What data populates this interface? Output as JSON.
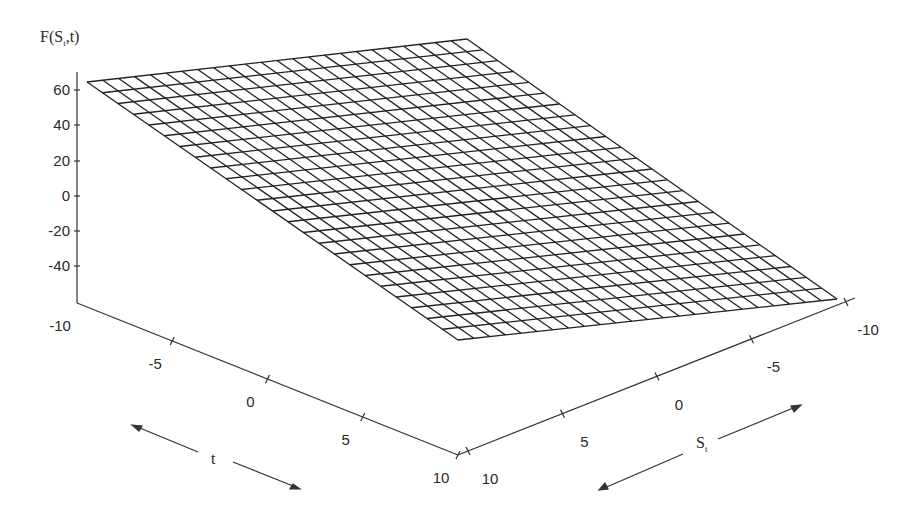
{
  "chart_data": {
    "type": "surface3d",
    "title": "",
    "zlabel": "F(S_t,t)",
    "xlabel": "t",
    "ylabel": "S_t",
    "z_ticks": [
      "60",
      "40",
      "20",
      "0",
      "-20",
      "-40"
    ],
    "t_ticks": [
      "-10",
      "-5",
      "0",
      "5",
      "10"
    ],
    "s_ticks": [
      "10",
      "5",
      "0",
      "-5",
      "-10"
    ],
    "t_range": [
      -10,
      10
    ],
    "s_range": [
      -10,
      10
    ],
    "z_range": [
      -60,
      70
    ],
    "grid_divisions": 24,
    "surface": "plane",
    "corners": [
      {
        "t": -10,
        "s": -10,
        "F": 65
      },
      {
        "t": -10,
        "s": 10,
        "F": 5
      },
      {
        "t": 10,
        "s": -10,
        "F": -45
      },
      {
        "t": 10,
        "s": 10,
        "F": -60
      }
    ],
    "mesh_color": "#222222",
    "background": "#ffffff"
  },
  "labels": {
    "zlabel_main": "F(S",
    "zlabel_sub": "t",
    "zlabel_tail": ",t)",
    "t_axis": "t",
    "s_axis_main": "S",
    "s_axis_sub": "t"
  }
}
